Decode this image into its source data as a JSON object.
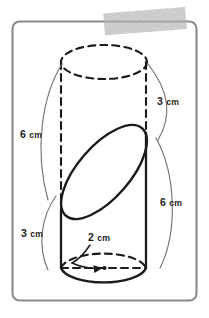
{
  "figure": {
    "frame": {
      "name": "worksheet-frame",
      "stroke_color": "#8a8a8c",
      "fill_color": "#ffffff"
    },
    "redaction": {
      "name": "gray-marker-smudge",
      "color": "#9d9d9f",
      "note": ""
    },
    "solid": {
      "name": "cylinder",
      "outline_color": "#1b1b1b",
      "top_face_style": "dashed",
      "bottom_face_front_style": "solid",
      "bottom_face_back_style": "dashed",
      "slant_cut_style": "solid",
      "left_edge_upper_style": "dashed",
      "left_edge_lower_style": "solid",
      "right_edge_upper_style": "dashed",
      "right_edge_lower_style": "solid"
    },
    "labels": [
      {
        "id": "label-top-right",
        "value": "3",
        "unit": "cm",
        "text": "3 cm",
        "x": 172,
        "y": 101,
        "side": "right",
        "measures": "slant-height-short"
      },
      {
        "id": "label-left-upper",
        "value": "6",
        "unit": "cm",
        "text": "6 cm",
        "x": 35,
        "y": 134,
        "side": "left",
        "measures": "slant-height-long"
      },
      {
        "id": "label-right-lower",
        "value": "6",
        "unit": "cm",
        "text": "6 cm",
        "x": 175,
        "y": 202,
        "side": "right",
        "measures": "side-height-long"
      },
      {
        "id": "label-left-lower",
        "value": "3",
        "unit": "cm",
        "text": "3 cm",
        "x": 36,
        "y": 233,
        "side": "left",
        "measures": "side-height-short"
      },
      {
        "id": "label-radius",
        "value": "2",
        "unit": "cm",
        "text": "2 cm",
        "x": 103,
        "y": 237,
        "side": "center",
        "measures": "base-radius"
      }
    ],
    "callout_arcs": [
      {
        "id": "arc-left-6cm",
        "label_ref": "label-left-upper"
      },
      {
        "id": "arc-right-3cm",
        "label_ref": "label-top-right"
      },
      {
        "id": "arc-left-3cm",
        "label_ref": "label-left-lower"
      },
      {
        "id": "arc-right-6cm",
        "label_ref": "label-right-lower"
      }
    ],
    "radius_leader": {
      "name": "radius-leader-line",
      "from_label": "label-radius",
      "to_point": "base-center-dot",
      "arrow": true
    },
    "base_center_dot": {
      "name": "base-center-dot",
      "cx": 104,
      "cy": 268
    },
    "base_diameter_line": {
      "name": "base-diameter-dashed-line",
      "style": "dashed",
      "x1": 61,
      "x2": 146,
      "y": 268
    }
  }
}
